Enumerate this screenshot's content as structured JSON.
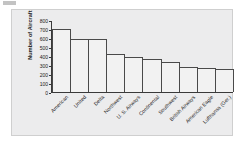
{
  "figure": {
    "scan_mark": "",
    "background_color": "#ececed",
    "plot_background_color": "#ffffff",
    "bar_fill_color": "#f2f2f2",
    "bar_edge_color": "#4a4a4a",
    "axis_color": "#3a3a3a"
  },
  "chart_data": {
    "type": "bar",
    "title": "",
    "xlabel": "",
    "ylabel": "Number of Aircraft",
    "ylim": [
      0,
      800
    ],
    "yticks": [
      0,
      100,
      200,
      300,
      400,
      500,
      600,
      700,
      800
    ],
    "ytick_labels": [
      "0",
      "100",
      "200",
      "300",
      "400",
      "500",
      "600",
      "700",
      "800"
    ],
    "grid": false,
    "legend": false,
    "categories": [
      "American",
      "United",
      "Delta",
      "Northwest",
      "U. S. Airways",
      "Continental",
      "Southwest",
      "British Airways",
      "American Eagle",
      "Lufthansa (Ger.)"
    ],
    "values": [
      710,
      600,
      600,
      425,
      395,
      370,
      340,
      280,
      265,
      255
    ]
  }
}
